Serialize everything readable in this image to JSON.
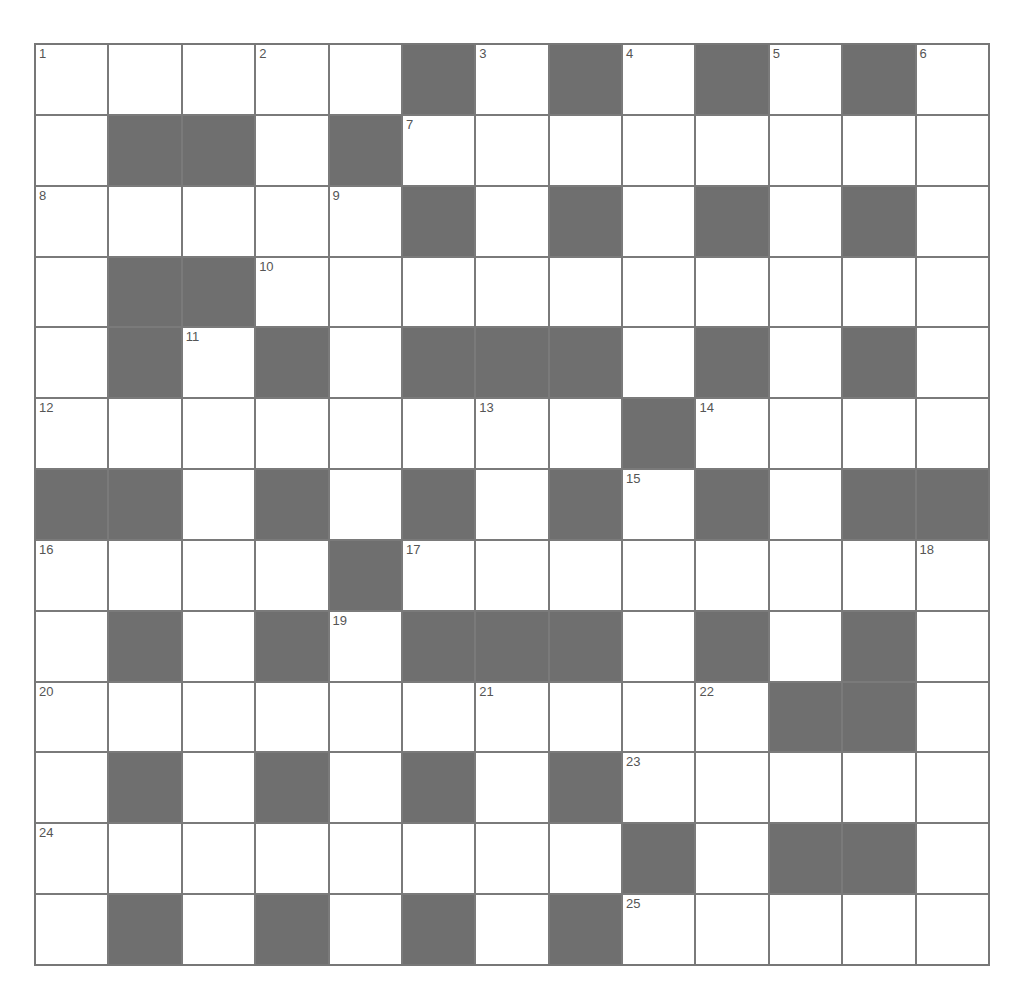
{
  "puzzle": {
    "rows": 13,
    "cols": 13,
    "colors": {
      "block": "#6f6f6f",
      "cell": "#ffffff",
      "line": "#777777",
      "number": "#555555"
    },
    "layout": [
      "WWWWWBWBWBWBW",
      "WBBWBWWWWWWWW",
      "WWWWWBWBWBWBW",
      "WBBWWWWWWWWWW",
      "WBWBWBBBWBWBW",
      "WWWWWWWWBWWWW",
      "BBWBWBWBWBWBB",
      "WWWWBWWWWWWWW",
      "WBWBWBBBWBWBW",
      "WWWWWWWWWWBBW",
      "WBWBWBWBWWWWW",
      "WWWWWWWWBWBBW",
      "WBWBWBWBWWWWW"
    ],
    "numbers": [
      {
        "r": 0,
        "c": 0,
        "n": "1"
      },
      {
        "r": 0,
        "c": 3,
        "n": "2"
      },
      {
        "r": 0,
        "c": 6,
        "n": "3"
      },
      {
        "r": 0,
        "c": 8,
        "n": "4"
      },
      {
        "r": 0,
        "c": 10,
        "n": "5"
      },
      {
        "r": 0,
        "c": 12,
        "n": "6"
      },
      {
        "r": 1,
        "c": 5,
        "n": "7"
      },
      {
        "r": 2,
        "c": 0,
        "n": "8"
      },
      {
        "r": 2,
        "c": 4,
        "n": "9"
      },
      {
        "r": 3,
        "c": 3,
        "n": "10"
      },
      {
        "r": 4,
        "c": 2,
        "n": "11"
      },
      {
        "r": 5,
        "c": 0,
        "n": "12"
      },
      {
        "r": 5,
        "c": 6,
        "n": "13"
      },
      {
        "r": 5,
        "c": 9,
        "n": "14"
      },
      {
        "r": 6,
        "c": 8,
        "n": "15"
      },
      {
        "r": 7,
        "c": 0,
        "n": "16"
      },
      {
        "r": 7,
        "c": 5,
        "n": "17"
      },
      {
        "r": 7,
        "c": 12,
        "n": "18"
      },
      {
        "r": 8,
        "c": 4,
        "n": "19"
      },
      {
        "r": 9,
        "c": 0,
        "n": "20"
      },
      {
        "r": 9,
        "c": 6,
        "n": "21"
      },
      {
        "r": 9,
        "c": 9,
        "n": "22"
      },
      {
        "r": 10,
        "c": 8,
        "n": "23"
      },
      {
        "r": 11,
        "c": 0,
        "n": "24"
      },
      {
        "r": 12,
        "c": 8,
        "n": "25"
      }
    ]
  }
}
